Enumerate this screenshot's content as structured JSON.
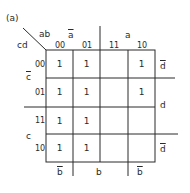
{
  "figure_label": "(a)",
  "corner": {
    "top_vars": "ab",
    "left_vars": "cd"
  },
  "columns": {
    "codes": [
      "00",
      "01",
      "11",
      "10"
    ],
    "top_group_labels": [
      {
        "label": "a",
        "overline": true,
        "span": "00-01"
      },
      {
        "label": "a",
        "overline": false,
        "span": "11-10"
      }
    ],
    "bottom_group_labels": [
      {
        "label": "b",
        "overline": true,
        "span": "00"
      },
      {
        "label": "b",
        "overline": false,
        "span": "01-11"
      },
      {
        "label": "b",
        "overline": true,
        "span": "10"
      }
    ]
  },
  "rows": {
    "codes": [
      "00",
      "01",
      "11",
      "10"
    ],
    "left_group_labels": [
      {
        "label": "c",
        "overline": true,
        "span": "00-01"
      },
      {
        "label": "c",
        "overline": false,
        "span": "11-10"
      }
    ],
    "right_group_labels": [
      {
        "label": "d",
        "overline": true,
        "span": "00"
      },
      {
        "label": "d",
        "overline": false,
        "span": "01-11"
      },
      {
        "label": "d",
        "overline": true,
        "span": "10"
      }
    ]
  },
  "cells": [
    [
      "1",
      "1",
      "",
      "1"
    ],
    [
      "1",
      "1",
      "",
      "1"
    ],
    [
      "1",
      "1",
      "",
      ""
    ],
    [
      "1",
      "1",
      "",
      ""
    ]
  ],
  "colors": {
    "line": "#2a2a2a",
    "text": "#2a2a2a",
    "background": "#ffffff"
  }
}
